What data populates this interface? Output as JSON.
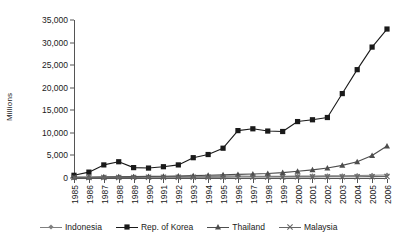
{
  "chart_data": {
    "type": "line",
    "title": "",
    "xlabel": "",
    "ylabel": "Millions",
    "ylim": [
      0,
      35000
    ],
    "ytick_values": [
      0,
      5000,
      10000,
      15000,
      20000,
      25000,
      30000,
      35000
    ],
    "ytick_labels": [
      "0",
      "5,000",
      "10,000",
      "15,000",
      "20,000",
      "25,000",
      "30,000",
      "35,000"
    ],
    "grid": false,
    "legend_position": "bottom",
    "categories": [
      "1985",
      "1986",
      "1987",
      "1988",
      "1989",
      "1990",
      "1991",
      "1992",
      "1993",
      "1994",
      "1995",
      "1996",
      "1997",
      "1998",
      "1999",
      "2000",
      "2001",
      "2002",
      "2003",
      "2004",
      "2005",
      "2006"
    ],
    "series": [
      {
        "name": "Indonesia",
        "marker": "diamond",
        "values": [
          200,
          220,
          250,
          280,
          300,
          320,
          330,
          350,
          380,
          400,
          430,
          450,
          400,
          380,
          400,
          430,
          450,
          480,
          500,
          550,
          600,
          650
        ]
      },
      {
        "name": "Rep. of Korea",
        "marker": "square",
        "values": [
          600,
          1300,
          2900,
          3600,
          2300,
          2200,
          2500,
          2900,
          4500,
          5200,
          6600,
          10500,
          10900,
          10400,
          10300,
          12500,
          12900,
          13400,
          18700,
          24000,
          29000,
          33000
        ]
      },
      {
        "name": "Thailand",
        "marker": "triangle",
        "values": [
          150,
          170,
          200,
          250,
          300,
          350,
          400,
          450,
          520,
          600,
          700,
          800,
          900,
          1000,
          1200,
          1500,
          1800,
          2200,
          2800,
          3600,
          5000,
          7100
        ]
      },
      {
        "name": "Malaysia",
        "marker": "cross",
        "values": [
          100,
          110,
          120,
          130,
          140,
          150,
          160,
          170,
          180,
          190,
          200,
          210,
          220,
          230,
          240,
          250,
          260,
          270,
          280,
          290,
          300,
          320
        ]
      }
    ],
    "colors": {
      "line": "#4d4d4d",
      "indonesia": "#808080",
      "korea": "#1a1a1a",
      "thailand": "#4d4d4d",
      "malaysia": "#666666",
      "axis": "#555555",
      "text": "#1a1a1a"
    }
  }
}
